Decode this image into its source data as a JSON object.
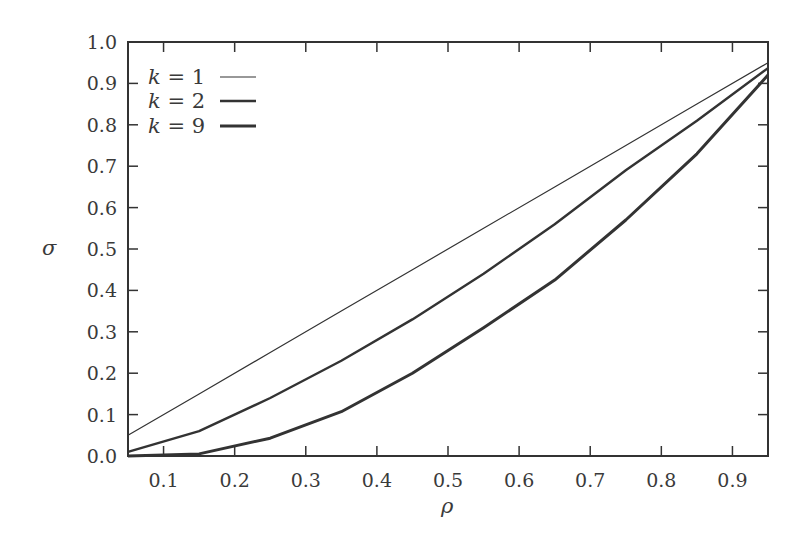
{
  "chart_data": {
    "type": "line",
    "title": "",
    "xlabel": "ρ",
    "ylabel": "σ",
    "xlim": [
      0.05,
      0.95
    ],
    "ylim": [
      0.0,
      1.0
    ],
    "grid": false,
    "legend_position": "upper-left",
    "x_ticks": [
      "0.1",
      "0.2",
      "0.3",
      "0.4",
      "0.5",
      "0.6",
      "0.7",
      "0.8",
      "0.9"
    ],
    "y_ticks": [
      "0.0",
      "0.1",
      "0.2",
      "0.3",
      "0.4",
      "0.5",
      "0.6",
      "0.7",
      "0.8",
      "0.9",
      "1.0"
    ],
    "x": [
      0.05,
      0.15,
      0.25,
      0.35,
      0.45,
      0.55,
      0.65,
      0.75,
      0.85,
      0.95
    ],
    "series": [
      {
        "name": "k = 1",
        "stroke_width": 1.2,
        "values": [
          0.05,
          0.15,
          0.25,
          0.35,
          0.45,
          0.55,
          0.65,
          0.75,
          0.85,
          0.95
        ]
      },
      {
        "name": "k = 2",
        "stroke_width": 2.4,
        "values": [
          0.01,
          0.06,
          0.14,
          0.23,
          0.33,
          0.44,
          0.56,
          0.69,
          0.81,
          0.937
        ]
      },
      {
        "name": "k = 9",
        "stroke_width": 3.0,
        "values": [
          0.0,
          0.005,
          0.043,
          0.107,
          0.2,
          0.31,
          0.425,
          0.57,
          0.73,
          0.92
        ]
      }
    ]
  },
  "legend": {
    "items": [
      {
        "k_symbol": "k",
        "eq": " = 1"
      },
      {
        "k_symbol": "k",
        "eq": " = 2"
      },
      {
        "k_symbol": "k",
        "eq": " = 9"
      }
    ]
  },
  "colors": {
    "line": "#333333",
    "axis": "#333333"
  }
}
